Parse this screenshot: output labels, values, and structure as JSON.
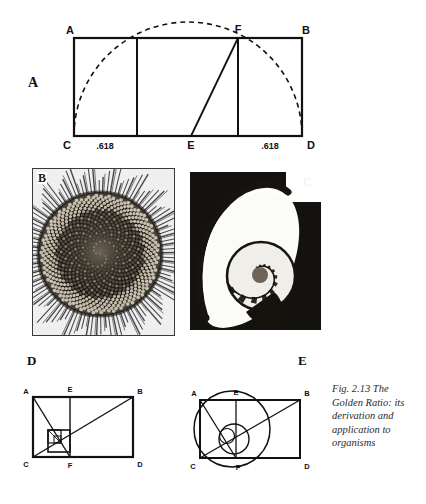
{
  "figure": {
    "caption_lines": [
      "Fig. 2.13   The",
      "Golden Ratio: its",
      "derivation and",
      "application to",
      "organisms"
    ],
    "caption_full": "Fig. 2.13 The Golden Ratio: its derivation and application to organisms"
  },
  "panels": {
    "a": {
      "letter": "A",
      "type": "geometric-construction",
      "vertices": [
        {
          "id": "A",
          "label": "A",
          "x": 74,
          "y": 38,
          "label_x": 70,
          "label_y": 30
        },
        {
          "id": "B",
          "label": "B",
          "x": 302,
          "y": 38,
          "label_x": 306,
          "label_y": 30
        },
        {
          "id": "C",
          "label": "C",
          "x": 74,
          "y": 136,
          "label_x": 68,
          "label_y": 146
        },
        {
          "id": "D",
          "label": "D",
          "x": 302,
          "y": 136,
          "label_x": 310,
          "label_y": 146
        },
        {
          "id": "E",
          "label": "E",
          "x": 191,
          "y": 136,
          "label_x": 188,
          "label_y": 146
        },
        {
          "id": "F",
          "label": "F",
          "x": 238,
          "y": 38,
          "label_x": 235,
          "label_y": 30
        }
      ],
      "measurements": [
        {
          "label": ".618",
          "x": 105,
          "y": 146
        },
        {
          "label": ".618",
          "x": 270,
          "y": 146
        }
      ],
      "internal_verticals": [
        137,
        238
      ],
      "diagonal": {
        "from": "E",
        "to": "F"
      },
      "arc": {
        "style": "dashed",
        "description": "semicircle from C through F to D"
      }
    },
    "b": {
      "letter": "B",
      "type": "photograph",
      "subject": "sunflower-seed-head-phyllotaxis"
    },
    "c": {
      "letter": "C",
      "type": "photograph",
      "subject": "nautilus-shell-cross-section"
    },
    "d": {
      "letter": "D",
      "type": "geometric-construction",
      "vertices": [
        {
          "id": "A",
          "label": "A",
          "label_x": 6,
          "label_y": 10
        },
        {
          "id": "E",
          "label": "E",
          "label_x": 55,
          "label_y": 8
        },
        {
          "id": "B",
          "label": "B",
          "label_x": 120,
          "label_y": 10
        },
        {
          "id": "C",
          "label": "C",
          "label_x": 6,
          "label_y": 82
        },
        {
          "id": "F",
          "label": "F",
          "label_x": 57,
          "label_y": 84
        },
        {
          "id": "D",
          "label": "D",
          "label_x": 120,
          "label_y": 82
        }
      ],
      "has_nested_squares": true,
      "has_circles": false
    },
    "e": {
      "letter": "E",
      "type": "geometric-construction",
      "vertices": [
        {
          "id": "A",
          "label": "A",
          "label_x": 18,
          "label_y": 12
        },
        {
          "id": "E",
          "label": "E",
          "label_x": 64,
          "label_y": 9
        },
        {
          "id": "B",
          "label": "B",
          "label_x": 128,
          "label_y": 12
        },
        {
          "id": "C",
          "label": "C",
          "label_x": 16,
          "label_y": 85
        },
        {
          "id": "F",
          "label": "F",
          "label_x": 68,
          "label_y": 86
        },
        {
          "id": "D",
          "label": "D",
          "label_x": 128,
          "label_y": 85
        }
      ],
      "has_nested_squares": true,
      "has_circles": true
    }
  },
  "colors": {
    "ink": "#111111",
    "paper": "#ffffff",
    "photo_dark": "#151515",
    "caption_ink": "#2a2a2a"
  }
}
